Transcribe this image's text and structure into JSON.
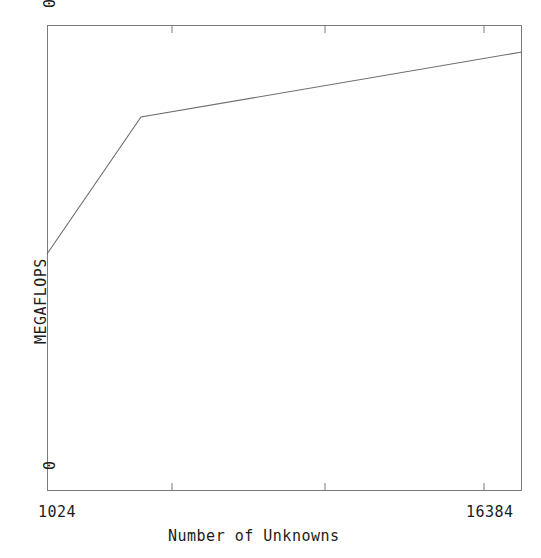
{
  "chart_data": {
    "type": "line",
    "title": "",
    "xlabel": "Number of Unknowns",
    "ylabel": "MEGAFLOPS",
    "x_scale": "log2",
    "xlim": [
      1024,
      16384
    ],
    "ylim": [
      0,
      0.5
    ],
    "x_tick_labels": [
      "1024",
      "16384"
    ],
    "y_tick_labels": [
      "0",
      "0.5"
    ],
    "grid": false,
    "legend": null,
    "x_minor_tick_count": 3,
    "series": [
      {
        "name": "MEGAFLOPS",
        "x": [
          1024,
          2048,
          16384
        ],
        "values": [
          0.245,
          0.401,
          0.471
        ],
        "color": "#6e6e6e"
      }
    ],
    "points_pixel": [
      {
        "x": 47,
        "y": 254
      },
      {
        "x": 141,
        "y": 117
      },
      {
        "x": 522,
        "y": 52
      }
    ],
    "axes_pixel": {
      "left": 47,
      "right": 522,
      "top": 25,
      "bottom": 491
    },
    "minor_ticks_pixel": [
      172,
      325,
      484
    ],
    "frame_color": "#7a7a7a",
    "line_color": "#6e6e6e",
    "background": "#ffffff"
  },
  "axes": {
    "y_top_label": "0.5",
    "y_bottom_label": "0",
    "x_left_label": "1024",
    "x_right_label": "16384",
    "y_title": "MEGAFLOPS",
    "x_title": "Number of Unknowns"
  }
}
